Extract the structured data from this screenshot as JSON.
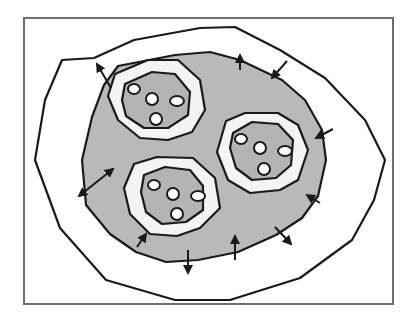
{
  "diagram": {
    "type": "schematic",
    "colors": {
      "background": "#ffffff",
      "frame": "#6e6e6e",
      "stroke": "#1a1a1a",
      "shaded_fill": "#b9b9b9",
      "ring_fill": "#f4f4f4",
      "inner_fill": "#b4b4b4",
      "dot_fill": "#ffffff"
    },
    "frame": {
      "x": 24,
      "y": 18,
      "width": 369,
      "height": 286
    },
    "outer_boundary": "94,58 134,40 200,28 235,27 280,50 325,78 365,120 385,160 374,200 352,240 300,278 230,300 175,300 106,280 60,228 35,160 45,100 62,60",
    "shaded_region": "118,66 175,55 210,52 240,60 282,80 305,100 322,130 326,160 318,196 302,218 276,235 238,252 198,260 166,262 136,252 110,234 86,205 82,160 92,117 104,85",
    "compartments": [
      {
        "id": "top-left",
        "ring": "115,74 148,60 178,60 200,80 205,110 192,132 168,140 140,138 118,120 108,96",
        "inner": "125,84 152,72 175,74 190,92 188,115 168,128 144,128 126,116 122,100",
        "dots": [
          {
            "cx": 134,
            "cy": 89,
            "rx": 6,
            "ry": 5
          },
          {
            "cx": 152,
            "cy": 99,
            "rx": 6,
            "ry": 6
          },
          {
            "cx": 177,
            "cy": 101,
            "rx": 7,
            "ry": 5
          },
          {
            "cx": 156,
            "cy": 119,
            "rx": 6,
            "ry": 6
          }
        ]
      },
      {
        "id": "right",
        "ring": "226,121 245,113 278,113 298,125 308,150 298,180 280,190 250,193 228,180 217,152",
        "inner": "233,133 252,122 278,124 293,140 291,165 276,178 252,180 236,168 230,148",
        "dots": [
          {
            "cx": 241,
            "cy": 139,
            "rx": 6,
            "ry": 5
          },
          {
            "cx": 260,
            "cy": 148,
            "rx": 6,
            "ry": 6
          },
          {
            "cx": 285,
            "cy": 151,
            "rx": 7,
            "ry": 5
          },
          {
            "cx": 264,
            "cy": 169,
            "rx": 6,
            "ry": 6
          }
        ]
      },
      {
        "id": "bottom",
        "ring": "134,164 157,157 193,158 215,178 220,208 200,228 177,236 150,234 130,214 124,188",
        "inner": "144,175 165,167 190,170 203,186 203,210 186,222 162,224 146,212 141,192",
        "dots": [
          {
            "cx": 154,
            "cy": 185,
            "rx": 6,
            "ry": 5
          },
          {
            "cx": 173,
            "cy": 194,
            "rx": 6,
            "ry": 6
          },
          {
            "cx": 198,
            "cy": 196,
            "rx": 7,
            "ry": 5
          },
          {
            "cx": 177,
            "cy": 214,
            "rx": 6,
            "ry": 6
          }
        ]
      }
    ],
    "arrows": [
      {
        "id": "outward-top-left",
        "x1": 111,
        "y1": 88,
        "x2": 97,
        "y2": 64,
        "heads": "end"
      },
      {
        "id": "outward-top",
        "x1": 240,
        "y1": 70,
        "x2": 240,
        "y2": 55,
        "heads": "end"
      },
      {
        "id": "inward-top-right",
        "x1": 287,
        "y1": 61,
        "x2": 272,
        "y2": 78,
        "heads": "end"
      },
      {
        "id": "inward-right",
        "x1": 333,
        "y1": 129,
        "x2": 316,
        "y2": 138,
        "heads": "end"
      },
      {
        "id": "bidirectional-left",
        "x1": 113,
        "y1": 169,
        "x2": 79,
        "y2": 196,
        "heads": "both"
      },
      {
        "id": "inward-bottom-left",
        "x1": 137,
        "y1": 247,
        "x2": 146,
        "y2": 234,
        "heads": "end"
      },
      {
        "id": "outward-bottom",
        "x1": 188,
        "y1": 250,
        "x2": 188,
        "y2": 273,
        "heads": "end"
      },
      {
        "id": "inward-bottom",
        "x1": 235,
        "y1": 260,
        "x2": 235,
        "y2": 236,
        "heads": "end"
      },
      {
        "id": "outward-bottom-right",
        "x1": 275,
        "y1": 227,
        "x2": 291,
        "y2": 244,
        "heads": "end"
      },
      {
        "id": "inward-right-lower",
        "x1": 320,
        "y1": 203,
        "x2": 307,
        "y2": 195,
        "heads": "end"
      }
    ]
  }
}
